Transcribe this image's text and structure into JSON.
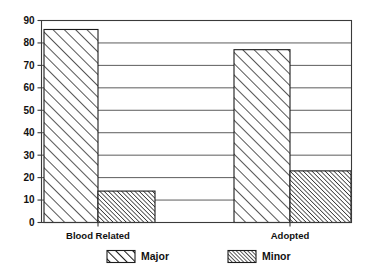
{
  "chart_data": {
    "type": "bar",
    "title": "",
    "subtitle": "",
    "xlabel": "",
    "ylabel": "",
    "categories": [
      "Blood Related",
      "Adopted"
    ],
    "series": [
      {
        "name": "Major",
        "values": [
          86,
          77
        ],
        "pattern": "wide-diagonal-hatch"
      },
      {
        "name": "Minor",
        "values": [
          14,
          23
        ],
        "pattern": "dense-diagonal-hatch"
      }
    ],
    "ylim": [
      0,
      90
    ],
    "ytick_values": [
      0,
      10,
      20,
      30,
      40,
      50,
      60,
      70,
      80,
      90
    ],
    "ytick_labels": [
      "0",
      "10",
      "20",
      "30",
      "40",
      "50",
      "60",
      "70",
      "80",
      "90"
    ],
    "grid": "horizontal",
    "legend_position": "bottom",
    "bar_gap": "none",
    "colors": {
      "axis": "#3a3a3a",
      "grid": "#4a4a4a",
      "bar_outline": "#1c1c1c",
      "bar_fill": "#ffffff",
      "hatch": "#2b2b2b",
      "background": "#ffffff",
      "text": "#111111"
    }
  },
  "legend": {
    "items": [
      {
        "label": "Major",
        "swatch": "major-swatch"
      },
      {
        "label": "Minor",
        "swatch": "minor-swatch"
      }
    ]
  },
  "axis": {
    "y_ticks": [
      "0",
      "10",
      "20",
      "30",
      "40",
      "50",
      "60",
      "70",
      "80",
      "90"
    ],
    "x_categories": [
      "Blood Related",
      "Adopted"
    ]
  }
}
